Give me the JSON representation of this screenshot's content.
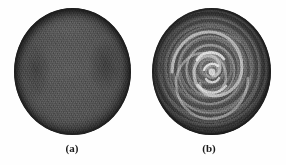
{
  "figure": {
    "background_color": "#fefefe",
    "panel_count": 2,
    "panels": [
      {
        "id": "a",
        "caption": "(a)",
        "description": "uniform grainy gray disc",
        "shape": "circle",
        "fill_color": "#555555",
        "rim_color": "#1e1e1e",
        "has_rings": false,
        "has_spiral": false
      },
      {
        "id": "b",
        "caption": "(b)",
        "description": "concentric rings with bright central spiral vortex",
        "shape": "circle",
        "fill_color": "#4a4a4a",
        "rim_color": "#191919",
        "ring_color": "#9a9a9a",
        "spiral_color": "#d8d8d8",
        "has_rings": true,
        "has_spiral": true,
        "ring_count": 5
      }
    ]
  }
}
